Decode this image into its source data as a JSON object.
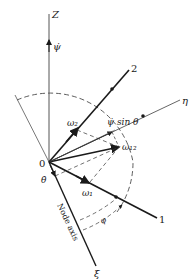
{
  "diagram": {
    "origin_label": "0",
    "axes": {
      "z": {
        "label": "Z"
      },
      "axis2": {
        "label": "2"
      },
      "eta": {
        "label": "η"
      },
      "axis1": {
        "label": "1"
      },
      "xi": {
        "label": "ξ"
      },
      "node_axis": {
        "label": "Node axis"
      }
    },
    "vectors": {
      "psi_dot": {
        "label": "ψ̇"
      },
      "psi_dot_sin_theta": {
        "label": "ψ̇ sin θ"
      },
      "omega2": {
        "label": "ω₂"
      },
      "omega12": {
        "label": "ω₁₂"
      },
      "omega1": {
        "label": "ω₁"
      },
      "theta_dot": {
        "label": "θ̇"
      }
    },
    "angles": {
      "phi": {
        "label": "φ"
      }
    },
    "colors": {
      "ink": "#1a1a1a",
      "thin": "#555555",
      "background": "#ffffff"
    }
  }
}
